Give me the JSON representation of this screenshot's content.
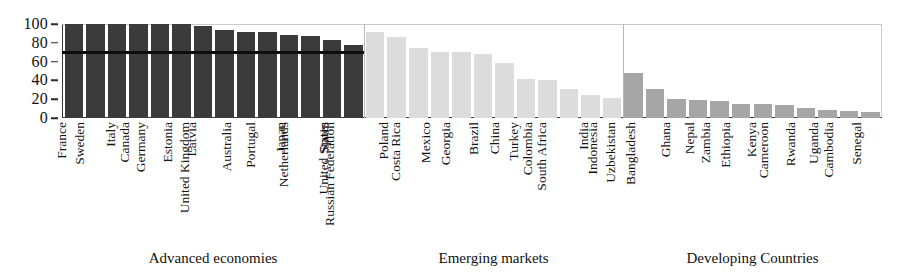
{
  "chart_data": {
    "type": "bar",
    "title": "",
    "subtitle": "",
    "xlabel": "",
    "ylabel": "",
    "ylim": [
      0,
      100
    ],
    "yticks": [
      0,
      20,
      40,
      60,
      80,
      100
    ],
    "ytick_labels": [
      "0",
      "20",
      "40",
      "60",
      "80",
      "100"
    ],
    "grid": false,
    "legend": false,
    "legend_position": "none",
    "orientation": "vertical",
    "annotations": [
      {
        "name": "advanced-economies-reference-line",
        "type": "horizontal-line",
        "value": 70,
        "spans_categories": [
          "France",
          "United States"
        ],
        "color": "#0d0d0d"
      }
    ],
    "groups": [
      {
        "name": "advanced",
        "label": "Advanced economies",
        "color": "#3b3b3b",
        "categories": [
          "France",
          "Sweden",
          "Italy",
          "Canada",
          "Germany",
          "Estonia",
          "Latvia",
          "United Kingdom",
          "Australia",
          "Portugal",
          "Japan",
          "Netherlands",
          "Spain",
          "United States"
        ],
        "values": [
          100,
          100,
          100,
          100,
          100,
          100,
          98,
          94,
          92,
          92,
          88,
          87,
          83,
          78
        ]
      },
      {
        "name": "emerging",
        "label": "Emerging markets",
        "color": "#dcdcdc",
        "categories": [
          "Russian Federation",
          "Poland",
          "Costa Rica",
          "Mexico",
          "Georgia",
          "Brazil",
          "China",
          "Turkey",
          "Colombia",
          "South Africa",
          "India",
          "Indonesia"
        ],
        "values": [
          92,
          86,
          74,
          70,
          70,
          68,
          58,
          41,
          40,
          31,
          24,
          21
        ]
      },
      {
        "name": "developing",
        "label": "Developing Countries",
        "color": "#a6a6a6",
        "categories": [
          "Uzbekistan",
          "Bangladesh",
          "Ghana",
          "Nepal",
          "Zambia",
          "Ethiopia",
          "Kenya",
          "Cameroon",
          "Rwanda",
          "Uganda",
          "Cambodia",
          "Senegal"
        ],
        "values": [
          48,
          31,
          20,
          19,
          18,
          15,
          15,
          14,
          11,
          8,
          7,
          6
        ]
      }
    ],
    "categories": [
      "France",
      "Sweden",
      "Italy",
      "Canada",
      "Germany",
      "Estonia",
      "Latvia",
      "United Kingdom",
      "Australia",
      "Portugal",
      "Japan",
      "Netherlands",
      "Spain",
      "United States",
      "Russian Federation",
      "Poland",
      "Costa Rica",
      "Mexico",
      "Georgia",
      "Brazil",
      "China",
      "Turkey",
      "Colombia",
      "South Africa",
      "India",
      "Indonesia",
      "Uzbekistan",
      "Bangladesh",
      "Ghana",
      "Nepal",
      "Zambia",
      "Ethiopia",
      "Kenya",
      "Cameroon",
      "Rwanda",
      "Uganda",
      "Cambodia",
      "Senegal"
    ],
    "values": [
      100,
      100,
      100,
      100,
      100,
      100,
      98,
      94,
      92,
      92,
      88,
      87,
      83,
      78,
      92,
      86,
      74,
      70,
      70,
      68,
      58,
      41,
      40,
      31,
      24,
      21,
      48,
      31,
      20,
      19,
      18,
      15,
      15,
      14,
      11,
      8,
      7,
      6
    ]
  },
  "colors": {
    "advanced_bar": "#3b3b3b",
    "emerging_bar": "#dcdcdc",
    "developing_bar": "#a6a6a6",
    "reference_line": "#0d0d0d",
    "axis": "#3a3a3a",
    "frame": "#c9c9c9",
    "text": "#141414",
    "background": "#ffffff"
  }
}
